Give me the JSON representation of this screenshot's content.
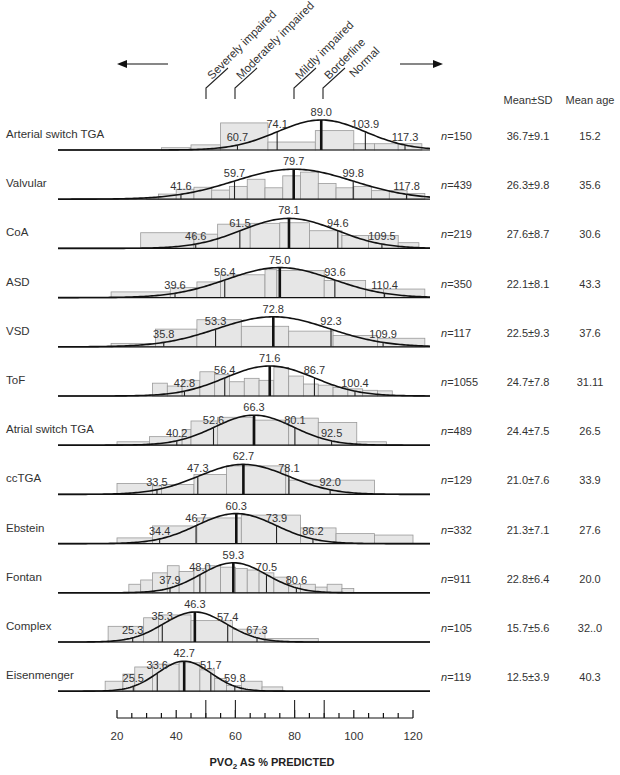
{
  "chart_data": {
    "type": "bar",
    "subtype": "histogram-with-normal-curve",
    "title": "",
    "xlabel": "PVO2 AS % PREDICTED",
    "xlabel_main": "PVO",
    "xlabel_sub": "2",
    "xlabel_rest": " AS % PREDICTED",
    "ylabel": "",
    "xlim": [
      20,
      120
    ],
    "x_ticks": [
      20,
      40,
      60,
      80,
      100,
      120
    ],
    "x_minor_step": 5,
    "reference_lines": [
      50,
      60,
      80,
      90
    ],
    "grid": false,
    "categories_header": {
      "arrow_left": "←",
      "arrow_right": "→",
      "thresholds": [
        {
          "label": "Severely impaired",
          "value": 50
        },
        {
          "label": "Moderately impaired",
          "value": 60
        },
        {
          "label": "Mildly impaired",
          "value": 80
        },
        {
          "label": "Borderline",
          "value": 90
        },
        {
          "label": "Normal",
          "value": 90
        }
      ],
      "col_mean_sd": "Mean±SD",
      "col_mean_age": "Mean age"
    },
    "series": [
      {
        "name": "Arterial switch TGA",
        "n": "n=150",
        "mean_sd": "36.7±9.1",
        "mean_age": "15.2",
        "percentiles": [
          60.7,
          74.1,
          89.0,
          103.9,
          117.3
        ],
        "mean": 89.0,
        "sd": 14.9,
        "bins": [
          [
            35,
            45,
            0.08
          ],
          [
            45,
            55,
            0.18
          ],
          [
            55,
            71,
            0.95
          ],
          [
            71,
            87,
            0.28
          ],
          [
            87,
            100,
            0.68
          ],
          [
            100,
            107,
            0.22
          ],
          [
            107,
            115,
            0.22
          ],
          [
            115,
            123,
            0.22
          ]
        ]
      },
      {
        "name": "Valvular",
        "n": "n=439",
        "mean_sd": "26.3±9.8",
        "mean_age": "35.6",
        "percentiles": [
          41.6,
          59.7,
          79.7,
          99.8,
          117.8
        ],
        "mean": 79.7,
        "sd": 20.0,
        "bins": [
          [
            30,
            34,
            0.05
          ],
          [
            34,
            40,
            0.18
          ],
          [
            40,
            46,
            0.35
          ],
          [
            46,
            52,
            0.42
          ],
          [
            52,
            58,
            0.32
          ],
          [
            58,
            64,
            0.45
          ],
          [
            64,
            70,
            0.7
          ],
          [
            70,
            76,
            0.4
          ],
          [
            76,
            82,
            0.82
          ],
          [
            82,
            88,
            0.95
          ],
          [
            88,
            94,
            0.55
          ],
          [
            94,
            100,
            0.4
          ],
          [
            100,
            106,
            0.45
          ],
          [
            106,
            112,
            0.3
          ],
          [
            112,
            118,
            0.3
          ],
          [
            118,
            124,
            0.2
          ]
        ]
      },
      {
        "name": "CoA",
        "n": "n=219",
        "mean_sd": "27.6±8.7",
        "mean_age": "30.6",
        "percentiles": [
          46.6,
          61.5,
          78.1,
          94.6,
          109.5
        ],
        "mean": 78.1,
        "sd": 16.0,
        "bins": [
          [
            28,
            46,
            0.55
          ],
          [
            46,
            54,
            0.5
          ],
          [
            54,
            65,
            0.85
          ],
          [
            65,
            75,
            0.88
          ],
          [
            75,
            85,
            0.9
          ],
          [
            85,
            96,
            0.62
          ],
          [
            96,
            105,
            0.45
          ],
          [
            105,
            115,
            0.45
          ],
          [
            115,
            122,
            0.2
          ]
        ]
      },
      {
        "name": "ASD",
        "n": "n=350",
        "mean_sd": "22.1±8.1",
        "mean_age": "43.3",
        "percentiles": [
          39.6,
          56.4,
          75.0,
          93.6,
          110.4
        ],
        "mean": 75.0,
        "sd": 18.0,
        "bins": [
          [
            18,
            38,
            0.2
          ],
          [
            38,
            47,
            0.35
          ],
          [
            47,
            55,
            0.55
          ],
          [
            55,
            70,
            0.8
          ],
          [
            70,
            74,
            0.98
          ],
          [
            74,
            90,
            0.95
          ],
          [
            90,
            104,
            0.6
          ],
          [
            104,
            110,
            0.3
          ],
          [
            110,
            124,
            0.3
          ]
        ]
      },
      {
        "name": "VSD",
        "n": "n=117",
        "mean_sd": "22.5±9.3",
        "mean_age": "37.6",
        "percentiles": [
          35.8,
          53.3,
          72.8,
          92.3,
          109.9
        ],
        "mean": 72.8,
        "sd": 18.9,
        "bins": [
          [
            18,
            33,
            0.12
          ],
          [
            33,
            47,
            0.62
          ],
          [
            47,
            62,
            0.95
          ],
          [
            62,
            78,
            0.72
          ],
          [
            78,
            93,
            0.55
          ],
          [
            93,
            108,
            0.4
          ],
          [
            108,
            124,
            0.3
          ]
        ]
      },
      {
        "name": "ToF",
        "n": "n=1055",
        "mean_sd": "24.7±7.8",
        "mean_age": "31.11",
        "percentiles": [
          42.8,
          56.4,
          71.6,
          86.7,
          100.4
        ],
        "mean": 71.6,
        "sd": 15.1,
        "bins": [
          [
            32,
            37,
            0.45
          ],
          [
            37,
            42,
            0.35
          ],
          [
            42,
            48,
            0.55
          ],
          [
            48,
            53,
            0.85
          ],
          [
            53,
            58,
            0.75
          ],
          [
            58,
            63,
            0.5
          ],
          [
            63,
            68,
            0.62
          ],
          [
            68,
            73,
            0.55
          ],
          [
            73,
            78,
            1.0
          ],
          [
            78,
            83,
            0.7
          ],
          [
            83,
            88,
            0.42
          ],
          [
            88,
            93,
            0.38
          ],
          [
            93,
            98,
            0.3
          ],
          [
            98,
            103,
            0.25
          ],
          [
            103,
            108,
            0.2
          ],
          [
            108,
            113,
            0.18
          ]
        ]
      },
      {
        "name": "Atrial switch TGA",
        "n": "n=489",
        "mean_sd": "24.4±7.5",
        "mean_age": "26.5",
        "percentiles": [
          40.2,
          52.6,
          66.3,
          80.1,
          92.5
        ],
        "mean": 66.3,
        "sd": 13.3,
        "bins": [
          [
            20,
            31,
            0.12
          ],
          [
            31,
            42,
            0.3
          ],
          [
            42,
            45,
            0.55
          ],
          [
            45,
            54,
            0.85
          ],
          [
            54,
            66,
            0.98
          ],
          [
            66,
            78,
            0.88
          ],
          [
            78,
            88,
            0.95
          ],
          [
            88,
            101,
            0.8
          ],
          [
            101,
            111,
            0.12
          ]
        ]
      },
      {
        "name": "ccTGA",
        "n": "n=129",
        "mean_sd": "21.0±7.6",
        "mean_age": "33.9",
        "percentiles": [
          33.5,
          47.3,
          62.7,
          78.1,
          92.0
        ],
        "mean": 62.7,
        "sd": 15.2,
        "bins": [
          [
            20,
            32,
            0.38
          ],
          [
            32,
            35,
            0.3
          ],
          [
            35,
            46,
            0.35
          ],
          [
            46,
            57,
            0.7
          ],
          [
            57,
            77,
            1.0
          ],
          [
            77,
            78,
            0.95
          ],
          [
            78,
            107,
            0.5
          ]
        ]
      },
      {
        "name": "Ebstein",
        "n": "n=332",
        "mean_sd": "21.3±7.1",
        "mean_age": "27.6",
        "percentiles": [
          34.4,
          46.7,
          60.3,
          73.9,
          86.2
        ],
        "mean": 60.3,
        "sd": 13.4,
        "bins": [
          [
            20,
            32,
            0.2
          ],
          [
            32,
            47,
            0.62
          ],
          [
            47,
            62,
            0.9
          ],
          [
            62,
            82,
            1.0
          ],
          [
            82,
            94,
            0.55
          ],
          [
            94,
            107,
            0.35
          ],
          [
            107,
            120,
            0.3
          ]
        ]
      },
      {
        "name": "Fontan",
        "n": "n=911",
        "mean_sd": "22.8±6.4",
        "mean_age": "20.0",
        "percentiles": [
          37.9,
          48.0,
          59.3,
          70.5,
          80.6
        ],
        "mean": 59.3,
        "sd": 11.2,
        "bins": [
          [
            24,
            28,
            0.3
          ],
          [
            28,
            32,
            0.45
          ],
          [
            32,
            37,
            0.7
          ],
          [
            37,
            41,
            0.95
          ],
          [
            41,
            46,
            0.75
          ],
          [
            46,
            50,
            0.85
          ],
          [
            50,
            55,
            0.95
          ],
          [
            55,
            60,
            0.9
          ],
          [
            60,
            64,
            0.85
          ],
          [
            64,
            68,
            0.8
          ],
          [
            68,
            73,
            0.7
          ],
          [
            73,
            78,
            0.55
          ],
          [
            78,
            82,
            0.3
          ],
          [
            82,
            87,
            0.3
          ],
          [
            87,
            91,
            0.2
          ],
          [
            91,
            96,
            0.3
          ],
          [
            96,
            100,
            0.15
          ]
        ]
      },
      {
        "name": "Complex",
        "n": "n=105",
        "mean_sd": "15.7±5.6",
        "mean_age": "32..0",
        "percentiles": [
          25.3,
          35.3,
          46.3,
          57.4,
          67.3
        ],
        "mean": 46.3,
        "sd": 10.6,
        "bins": [
          [
            17,
            29,
            0.55
          ],
          [
            29,
            34,
            0.85
          ],
          [
            34,
            45,
            0.95
          ],
          [
            45,
            59,
            0.75
          ],
          [
            59,
            70,
            0.45
          ],
          [
            70,
            88,
            0.12
          ]
        ]
      },
      {
        "name": "Eisenmenger",
        "n": "n=119",
        "mean_sd": "12.5±3.9",
        "mean_age": "40.3",
        "percentiles": [
          25.5,
          33.6,
          42.7,
          51.7,
          59.8
        ],
        "mean": 42.7,
        "sd": 9.0,
        "bins": [
          [
            16,
            22,
            0.35
          ],
          [
            22,
            26,
            0.6
          ],
          [
            26,
            32,
            0.85
          ],
          [
            32,
            41,
            0.95
          ],
          [
            41,
            48,
            1.0
          ],
          [
            48,
            53,
            0.75
          ],
          [
            53,
            57,
            0.45
          ],
          [
            57,
            62,
            0.2
          ],
          [
            62,
            69,
            0.35
          ],
          [
            69,
            76,
            0.15
          ]
        ]
      }
    ]
  }
}
